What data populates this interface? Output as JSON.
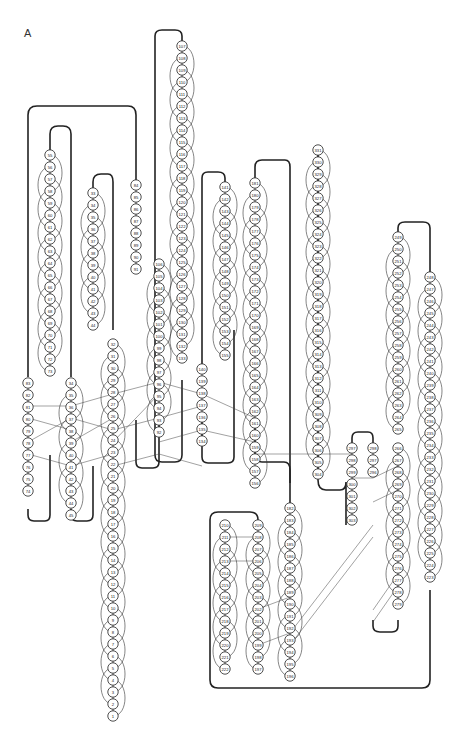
{
  "panel_label": "A",
  "diagram": {
    "type": "protein hydrogen-bond topology diagram",
    "node_radius": 5.2,
    "spacing": 12,
    "strands": [
      {
        "id": "s1",
        "x": 113,
        "y0": 716,
        "dir": -1,
        "from": 1,
        "to": 32
      },
      {
        "id": "s2",
        "x": 28,
        "y0": 383,
        "dir": 1,
        "from": 83,
        "to": 74,
        "descending": true
      },
      {
        "id": "s3",
        "x": 71,
        "y0": 383,
        "dir": 1,
        "from": 34,
        "to": 45
      },
      {
        "id": "s4",
        "x": 50,
        "y0": 155,
        "dir": 1,
        "from": 55,
        "to": 73
      },
      {
        "id": "s5",
        "x": 93,
        "y0": 193,
        "dir": 1,
        "from": 33,
        "to": 44
      },
      {
        "id": "s6",
        "x": 136,
        "y0": 185,
        "dir": 1,
        "from": 84,
        "to": 91
      },
      {
        "id": "s7",
        "x": 159,
        "y0": 264,
        "dir": 1,
        "from": 106,
        "to": 92,
        "descending": true
      },
      {
        "id": "s8",
        "x": 182,
        "y0": 46,
        "dir": 1,
        "from": 107,
        "to": 133
      },
      {
        "id": "s9",
        "x": 202,
        "y0": 369,
        "dir": 1,
        "from": 140,
        "to": 134,
        "descending": true
      },
      {
        "id": "s10",
        "x": 225,
        "y0": 187,
        "dir": 1,
        "from": 141,
        "to": 155
      },
      {
        "id": "s11",
        "x": 255,
        "y0": 183,
        "dir": 1,
        "from": 181,
        "to": 156,
        "descending": true
      },
      {
        "id": "s12",
        "x": 318,
        "y0": 150,
        "dir": 1,
        "from": 331,
        "to": 304,
        "descending": true
      },
      {
        "id": "s13",
        "x": 352,
        "y0": 448,
        "dir": 1,
        "from": 297,
        "to": 303
      },
      {
        "id": "s14",
        "x": 373,
        "y0": 448,
        "dir": 1,
        "from": 298,
        "to": 296,
        "descending": true
      },
      {
        "id": "s15",
        "x": 398,
        "y0": 237,
        "dir": 1,
        "from": 249,
        "to": 265
      },
      {
        "id": "s16",
        "x": 398,
        "y0": 448,
        "dir": 1,
        "from": 266,
        "to": 279
      },
      {
        "id": "s17",
        "x": 430,
        "y0": 277,
        "dir": 1,
        "from": 248,
        "to": 223,
        "descending": true
      },
      {
        "id": "s18",
        "x": 225,
        "y0": 525,
        "dir": 1,
        "from": 210,
        "to": 222
      },
      {
        "id": "s19",
        "x": 258,
        "y0": 525,
        "dir": 1,
        "from": 209,
        "to": 197,
        "descending": true
      },
      {
        "id": "s20",
        "x": 290,
        "y0": 508,
        "dir": 1,
        "from": 182,
        "to": 196
      }
    ],
    "loops": [
      {
        "d": "M28 377 V115 Q28 106 37 106 H128 Q136 106 136 115 V180"
      },
      {
        "d": "M50 150 V134 Q50 126 58 126 H63 Q71 126 71 134 V377"
      },
      {
        "d": "M93 188 V182 Q93 174 101 174 H108 Q113 174 113 182 V330"
      },
      {
        "d": "M28 509 V515 Q28 521 34 521 H45 Q50 521 50 515 V455"
      },
      {
        "d": "M71 509 V515 Q71 521 77 521 H87 Q93 521 93 515 V466"
      },
      {
        "d": "M136 420 V462 Q136 468 142 468 H153 Q159 468 159 462 V420"
      },
      {
        "d": "M182 41 V36 Q182 30 175 30 H162 Q155 30 155 36 V455 Q155 462 162 462 H175 Q182 462 182 455 V380"
      },
      {
        "d": "M202 364 V178 Q202 172 208 172 H218 Q225 172 225 178 V182"
      },
      {
        "d": "M202 420 V457 Q202 463 208 463 H228 Q234 463 234 457 V330"
      },
      {
        "d": "M255 178 V167 Q255 160 262 160 H285 Q290 160 290 167 V503"
      },
      {
        "d": "M290 483 V470 Q290 462 284 462 H262 Q255 462 255 455 V420"
      },
      {
        "d": "M318 145 V480 Q318 490 326 490 H340 Q346 490 346 482 V525"
      },
      {
        "d": "M352 448 V438 Q352 432 358 432 H368 Q373 432 373 438 V443"
      },
      {
        "d": "M398 232 V228 Q398 222 405 222 H423 Q430 222 430 228 V272"
      },
      {
        "d": "M373 620 V626 Q373 632 380 632 H392 Q398 632 398 626 V620"
      },
      {
        "d": "M430 590 V680 Q430 688 422 688 H218 Q210 688 210 680 V520 Q210 512 218 512 H250 Q258 512 258 520"
      }
    ],
    "cross_hbonds": [
      [
        28,
        406,
        71,
        406
      ],
      [
        28,
        418,
        71,
        430
      ],
      [
        28,
        442,
        71,
        418
      ],
      [
        28,
        454,
        71,
        466
      ],
      [
        71,
        406,
        113,
        394
      ],
      [
        71,
        418,
        113,
        430
      ],
      [
        71,
        442,
        113,
        418
      ],
      [
        71,
        466,
        113,
        454
      ],
      [
        113,
        394,
        159,
        382
      ],
      [
        113,
        430,
        159,
        418
      ],
      [
        113,
        442,
        159,
        394
      ],
      [
        113,
        466,
        159,
        454
      ],
      [
        159,
        382,
        202,
        394
      ],
      [
        159,
        418,
        202,
        406
      ],
      [
        159,
        442,
        202,
        430
      ],
      [
        159,
        454,
        202,
        466
      ],
      [
        202,
        394,
        255,
        418
      ],
      [
        202,
        430,
        255,
        442
      ],
      [
        255,
        454,
        352,
        454
      ],
      [
        352,
        478,
        373,
        478
      ],
      [
        373,
        478,
        398,
        466
      ],
      [
        373,
        502,
        398,
        490
      ],
      [
        225,
        537,
        258,
        537
      ],
      [
        225,
        561,
        258,
        561
      ],
      [
        258,
        609,
        290,
        597
      ],
      [
        258,
        645,
        290,
        633
      ],
      [
        290,
        633,
        373,
        525
      ],
      [
        290,
        645,
        373,
        537
      ],
      [
        398,
        574,
        373,
        610
      ],
      [
        398,
        586,
        373,
        622
      ]
    ]
  }
}
